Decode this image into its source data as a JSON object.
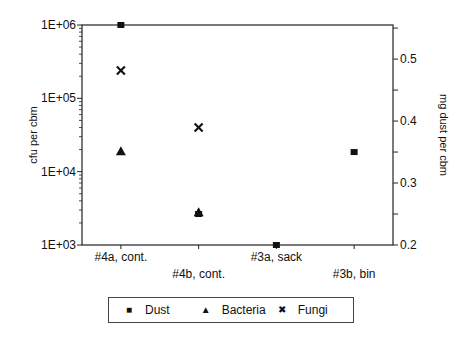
{
  "chart_data": {
    "type": "scatter",
    "title": "",
    "categories": [
      "#4a, cont.",
      "#4b, cont.",
      "#3a, sack",
      "#3b, bin"
    ],
    "xlabel": "",
    "ylabel": "cfu per cbm",
    "ylabel_right": "mg dust per cbm",
    "y_scale": "log",
    "ylim": [
      1000,
      1000000
    ],
    "y_ticks": [
      "1E+03",
      "1E+04",
      "1E+05",
      "1E+06"
    ],
    "ylim_right": [
      0.2,
      0.555
    ],
    "y_ticks_right": [
      "0.2",
      "0.3",
      "0.4",
      "0.5"
    ],
    "grid": false,
    "legend_position": "bottom",
    "series": [
      {
        "name": "Dust",
        "marker": "square",
        "axis": "right",
        "values": [
          0.555,
          0.25,
          0.2,
          0.35
        ]
      },
      {
        "name": "Bacteria",
        "marker": "triangle",
        "axis": "left",
        "values": [
          19000,
          2800,
          null,
          null
        ]
      },
      {
        "name": "Fungi",
        "marker": "x",
        "axis": "left",
        "values": [
          240000,
          40000,
          null,
          null
        ]
      }
    ]
  },
  "legend": {
    "items": [
      {
        "label": "Dust",
        "symbol": "■"
      },
      {
        "label": "Bacteria",
        "symbol": "▲"
      },
      {
        "label": "Fungi",
        "symbol": "✖"
      }
    ]
  }
}
